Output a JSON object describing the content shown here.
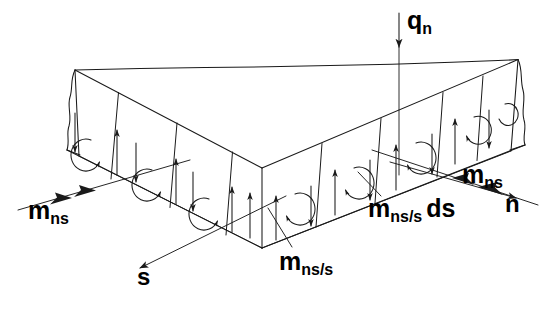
{
  "figure": {
    "background_color": "#ffffff",
    "line_color": "#1a1a1a",
    "width": 546,
    "height": 310
  },
  "labels": {
    "q_n": {
      "base": "q",
      "sub": "n",
      "full": "q_n",
      "role": "distributed-transverse-load"
    },
    "m_ns_left": {
      "base": "m",
      "sub": "ns",
      "full": "m_ns",
      "role": "twisting-moment-vector"
    },
    "m_ns_right": {
      "base": "m",
      "sub": "ns",
      "full": "m_ns",
      "role": "twisting-moment-vector"
    },
    "m_ns_s": {
      "base": "m",
      "sub": "ns/s",
      "full": "m_ns/s",
      "role": "twisting-moment-gradient"
    },
    "m_ns_s_ds": {
      "base": "m",
      "sub": "ns/s",
      "suffix": "ds",
      "full": "m_ns/s ds",
      "role": "incremental-twisting-moment"
    },
    "s": {
      "base": "s",
      "full": "s",
      "role": "tangential-axis"
    },
    "n": {
      "base": "n",
      "full": "n",
      "role": "normal-axis"
    }
  },
  "annotations": {
    "load_arrow": {
      "name": "q_n",
      "direction": "down",
      "heads": 1
    },
    "moment_arrow_left": {
      "name": "m_ns",
      "direction": "down-left",
      "heads": 2
    },
    "moment_arrow_right": {
      "name": "m_ns",
      "direction": "down-right",
      "heads": 2
    },
    "axis_arrow_s": {
      "name": "s",
      "direction": "down-left",
      "heads": 1
    },
    "axis_arrow_n": {
      "name": "n",
      "direction": "down-right",
      "heads": 1
    }
  },
  "force_couples": {
    "description": "Vertical force pairs replacing the twisting moment on each strip",
    "left_face_pattern": [
      "down",
      "curl-ccw",
      "up"
    ],
    "right_face_pattern": [
      "up",
      "curl-cw",
      "down"
    ],
    "left_face_strip_count": 3,
    "right_face_strip_count": 3,
    "left_face_edge_arrow": "down",
    "right_face_edge_arrow": "down"
  },
  "geometry": {
    "shape": "re-entrant corner slab edge strip",
    "left_end": "break-line",
    "right_end": "break-line",
    "corner_apex": "bottom-center"
  }
}
